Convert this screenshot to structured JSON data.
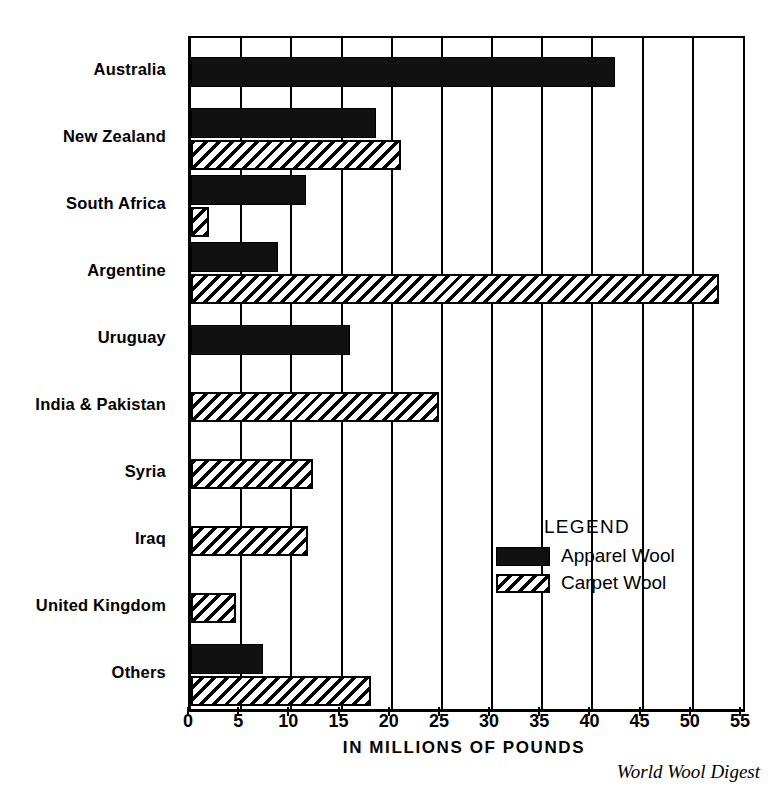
{
  "chart_data": {
    "type": "bar",
    "orientation": "horizontal",
    "title": "",
    "xlabel": "IN MILLIONS OF POUNDS",
    "ylabel": "",
    "xlim": [
      0,
      55
    ],
    "xticks": [
      0,
      5,
      10,
      15,
      20,
      25,
      30,
      35,
      40,
      45,
      50,
      55
    ],
    "xtick_labels": [
      "0",
      "5",
      "10",
      "15",
      "20",
      "25",
      "30",
      "35",
      "40",
      "45",
      "50",
      "55"
    ],
    "grid": true,
    "grid_axis": "x",
    "legend_position": "inside-right-middle",
    "legend_title": "LEGEND",
    "categories": [
      "Australia",
      "New Zealand",
      "South Africa",
      "Argentine",
      "Uruguay",
      "India & Pakistan",
      "Syria",
      "Iraq",
      "United Kingdom",
      "Others"
    ],
    "series": [
      {
        "name": "Apparel Wool",
        "fill": "solid-black",
        "color": "#111111",
        "values": [
          42.2,
          18.4,
          11.5,
          8.7,
          15.8,
          0,
          0,
          0,
          0,
          7.2
        ]
      },
      {
        "name": "Carpet Wool",
        "fill": "diagonal-hatch",
        "color": "#ffffff",
        "values": [
          0,
          20.9,
          1.8,
          52.6,
          0,
          24.7,
          12.2,
          11.7,
          4.5,
          17.9
        ]
      }
    ],
    "source_credit": "World Wool Digest"
  },
  "axis": {
    "x_title": "IN MILLIONS OF POUNDS"
  },
  "legend": {
    "title": "LEGEND",
    "entries": [
      {
        "label": "Apparel  Wool",
        "fill": "solid-black"
      },
      {
        "label": "Carpet Wool",
        "fill": "diagonal-hatch"
      }
    ]
  },
  "credit": {
    "text": "World Wool Digest"
  },
  "colors": {
    "ink": "#000000",
    "paper": "#ffffff",
    "apparel_fill": "#111111"
  }
}
